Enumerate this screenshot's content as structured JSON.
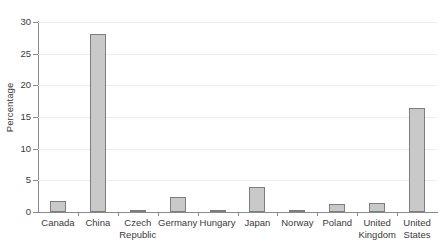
{
  "chart_data": {
    "type": "bar",
    "title": "",
    "xlabel": "",
    "ylabel": "Percentage",
    "ylim": [
      0,
      30
    ],
    "yticks": [
      0,
      5,
      10,
      15,
      20,
      25,
      30
    ],
    "ytick_labels": [
      "0",
      "5",
      "10",
      "15",
      "20",
      "25",
      "30"
    ],
    "grid": true,
    "legend": null,
    "categories": [
      "Canada",
      "China",
      "Czech Republic",
      "Germany",
      "Hungary",
      "Japan",
      "Norway",
      "Poland",
      "United Kingdom",
      "United States"
    ],
    "category_lines": [
      [
        "Canada"
      ],
      [
        "China"
      ],
      [
        "Czech",
        "Republic"
      ],
      [
        "Germany"
      ],
      [
        "Hungary"
      ],
      [
        "Japan"
      ],
      [
        "Norway"
      ],
      [
        "Poland"
      ],
      [
        "United",
        "Kingdom"
      ],
      [
        "United",
        "States"
      ]
    ],
    "values": [
      1.8,
      28.1,
      0.35,
      2.4,
      0.3,
      3.9,
      0.2,
      1.2,
      1.5,
      16.4
    ],
    "bar_color": "#c9c9c9",
    "bar_edge_color": "#7d7d7d",
    "axis_color": "#8a8a8a",
    "grid_color": "#ececf2",
    "text_color": "#3a3a3a",
    "background": "#ffffff"
  }
}
